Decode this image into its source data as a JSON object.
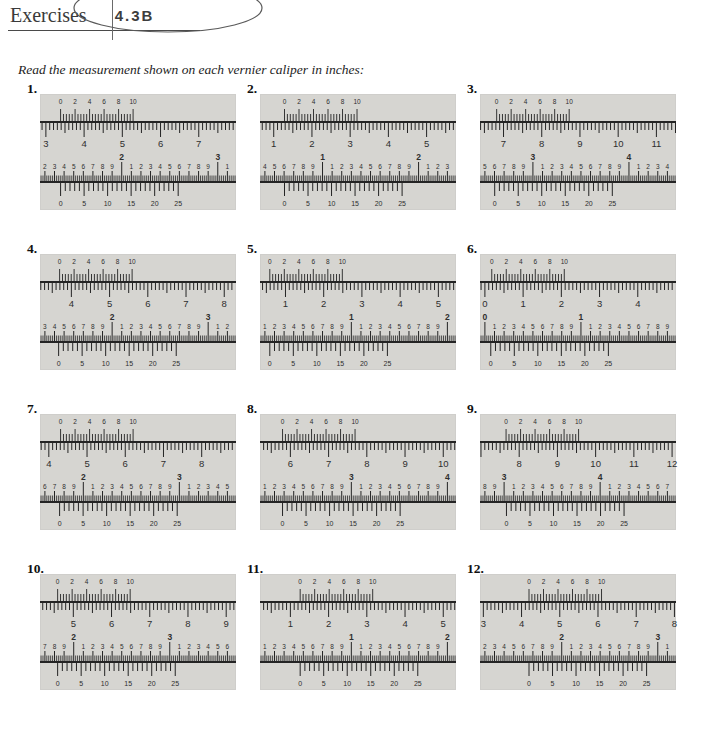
{
  "header": {
    "title": "Exercises",
    "section_code": "4.3B"
  },
  "instruction": "Read the measurement shown on each vernier caliper in inches:",
  "colors": {
    "panel_bg": "#d6d5d1",
    "ink": "#242424",
    "number_ink": "#2e2e2e",
    "annotation": "#5a5a5a"
  },
  "scales": {
    "top_vernier_labels": [
      "0",
      "2",
      "4",
      "6",
      "8",
      "10"
    ],
    "bottom_vernier_labels": [
      "0",
      "5",
      "10",
      "15",
      "20",
      "25"
    ]
  },
  "problems": [
    {
      "number": "1.",
      "top": {
        "main_numbers": [
          "3",
          "4",
          "5",
          "6",
          "7"
        ],
        "main_offset": 0.03,
        "vernier_offset": 0.105
      },
      "bottom": {
        "digits": [
          "2",
          "3",
          "4",
          "5",
          "6",
          "7",
          "8",
          "9",
          "^2",
          "1",
          "2",
          "3",
          "4",
          "5",
          "6",
          "7",
          "8",
          "9",
          "^3",
          "1"
        ],
        "vernier_offset": 0.105
      }
    },
    {
      "number": "2.",
      "top": {
        "main_numbers": [
          "1",
          "2",
          "3",
          "4",
          "5"
        ],
        "main_offset": 0.07,
        "vernier_offset": 0.125
      },
      "bottom": {
        "digits": [
          "4",
          "5",
          "6",
          "7",
          "8",
          "9",
          "^1",
          "1",
          "2",
          "3",
          "4",
          "5",
          "6",
          "7",
          "8",
          "9",
          "^2",
          "1",
          "2",
          "3"
        ],
        "vernier_offset": 0.125
      }
    },
    {
      "number": "3.",
      "top": {
        "main_numbers": [
          "7",
          "8",
          "9",
          "10",
          "11"
        ],
        "main_offset": 0.12,
        "vernier_offset": 0.085
      },
      "bottom": {
        "digits": [
          "5",
          "6",
          "7",
          "8",
          "9",
          "^3",
          "1",
          "2",
          "3",
          "4",
          "5",
          "6",
          "7",
          "8",
          "9",
          "^4",
          "1",
          "2",
          "3",
          "4"
        ],
        "vernier_offset": 0.075
      }
    },
    {
      "number": "4.",
      "top": {
        "main_numbers": [
          "4",
          "5",
          "6",
          "7",
          "8"
        ],
        "main_offset": 0.16,
        "vernier_offset": 0.1
      },
      "bottom": {
        "digits": [
          "3",
          "4",
          "5",
          "6",
          "7",
          "8",
          "9",
          "^2",
          "1",
          "2",
          "3",
          "4",
          "5",
          "6",
          "7",
          "8",
          "9",
          "^3",
          "1",
          "2"
        ],
        "vernier_offset": 0.095
      }
    },
    {
      "number": "5.",
      "top": {
        "main_numbers": [
          "1",
          "2",
          "3",
          "4",
          "5"
        ],
        "main_offset": 0.13,
        "vernier_offset": 0.05
      },
      "bottom": {
        "digits": [
          "1",
          "2",
          "3",
          "4",
          "5",
          "6",
          "7",
          "8",
          "9",
          "^1",
          "1",
          "2",
          "3",
          "4",
          "5",
          "6",
          "7",
          "8",
          "9",
          "^2"
        ],
        "vernier_offset": 0.05
      }
    },
    {
      "number": "6.",
      "top": {
        "main_numbers": [
          "0",
          "1",
          "2",
          "3",
          "4"
        ],
        "main_offset": 0.025,
        "vernier_offset": 0.06
      },
      "bottom": {
        "digits": [
          "^0",
          "1",
          "2",
          "3",
          "4",
          "5",
          "6",
          "7",
          "8",
          "9",
          "^1",
          "1",
          "2",
          "3",
          "4",
          "5",
          "6",
          "7",
          "8",
          "9"
        ],
        "vernier_offset": 0.055
      }
    },
    {
      "number": "7.",
      "top": {
        "main_numbers": [
          "4",
          "5",
          "6",
          "7",
          "8"
        ],
        "main_offset": 0.045,
        "vernier_offset": 0.105
      },
      "bottom": {
        "digits": [
          "6",
          "7",
          "8",
          "9",
          "^2",
          "1",
          "2",
          "3",
          "4",
          "5",
          "6",
          "7",
          "8",
          "9",
          "^3",
          "1",
          "2",
          "3",
          "4",
          "5"
        ],
        "vernier_offset": 0.1
      }
    },
    {
      "number": "8.",
      "top": {
        "main_numbers": [
          "6",
          "7",
          "8",
          "9",
          "10"
        ],
        "main_offset": 0.155,
        "vernier_offset": 0.115
      },
      "bottom": {
        "digits": [
          "1",
          "2",
          "3",
          "4",
          "5",
          "6",
          "7",
          "8",
          "9",
          "^3",
          "1",
          "2",
          "3",
          "4",
          "5",
          "6",
          "7",
          "8",
          "9",
          "^4"
        ],
        "vernier_offset": 0.115
      }
    },
    {
      "number": "9.",
      "top": {
        "main_numbers": [
          "8",
          "9",
          "10",
          "11",
          "12"
        ],
        "main_offset": 0.2,
        "vernier_offset": 0.133
      },
      "bottom": {
        "digits": [
          "8",
          "9",
          "^3",
          "1",
          "2",
          "3",
          "4",
          "5",
          "6",
          "7",
          "8",
          "9",
          "^4",
          "1",
          "2",
          "3",
          "4",
          "5",
          "6",
          "7"
        ],
        "vernier_offset": 0.135
      }
    },
    {
      "number": "10.",
      "top": {
        "main_numbers": [
          "5",
          "6",
          "7",
          "8",
          "9"
        ],
        "main_offset": 0.17,
        "vernier_offset": 0.09
      },
      "bottom": {
        "digits": [
          "7",
          "8",
          "9",
          "^2",
          "1",
          "2",
          "3",
          "4",
          "5",
          "6",
          "7",
          "8",
          "9",
          "^3",
          "1",
          "2",
          "3",
          "4",
          "5",
          "6"
        ],
        "vernier_offset": 0.09
      }
    },
    {
      "number": "11.",
      "top": {
        "main_numbers": [
          "1",
          "2",
          "3",
          "4",
          "5"
        ],
        "main_offset": 0.155,
        "vernier_offset": 0.205
      },
      "bottom": {
        "digits": [
          "1",
          "2",
          "3",
          "4",
          "5",
          "6",
          "7",
          "8",
          "9",
          "^1",
          "1",
          "2",
          "3",
          "4",
          "5",
          "6",
          "7",
          "8",
          "9",
          "^2"
        ],
        "vernier_offset": 0.205
      }
    },
    {
      "number": "12.",
      "top": {
        "main_numbers": [
          "3",
          "4",
          "5",
          "6",
          "7",
          "8"
        ],
        "main_offset": 0.017,
        "vernier_offset": 0.25
      },
      "bottom": {
        "digits": [
          "2",
          "3",
          "4",
          "5",
          "6",
          "7",
          "8",
          "9",
          "^2",
          "1",
          "2",
          "3",
          "4",
          "5",
          "6",
          "7",
          "8",
          "9",
          "^3",
          "1"
        ],
        "vernier_offset": 0.25
      }
    }
  ]
}
